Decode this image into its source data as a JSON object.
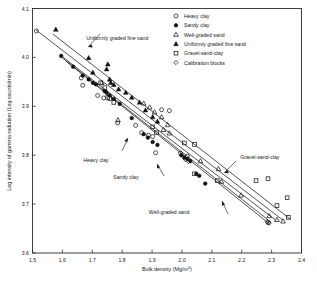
{
  "chart_data": {
    "type": "scatter",
    "title": "",
    "xlabel": "Bulk density (Mg/m³)",
    "ylabel": "Log intensity of gamma radiation (Log counts/min)",
    "xlim": [
      1.5,
      2.4
    ],
    "ylim": [
      3.6,
      4.1
    ],
    "xticks": [
      "1.5",
      "1.6",
      "1.7",
      "1.8",
      "1.9",
      "2.0",
      "2.1",
      "2.2",
      "2.3",
      "2.4"
    ],
    "yticks": [
      "3.6",
      "3.7",
      "3.8",
      "3.9",
      "4.0",
      "4.1"
    ],
    "grid": false,
    "legend_position": "top-right",
    "legend": [
      {
        "label": "Heavy clay",
        "marker": "open-circle"
      },
      {
        "label": "Sandy clay",
        "marker": "filled-circle"
      },
      {
        "label": "Well-graded sand",
        "marker": "open-triangle"
      },
      {
        "label": "Uniformly graded fine sand",
        "marker": "filled-triangle"
      },
      {
        "label": "Gravel-sand-clay",
        "marker": "open-square"
      },
      {
        "label": "Calibration blocks",
        "marker": "open-diamond"
      }
    ],
    "annotations": [
      {
        "text": "Uniformly graded fine sand",
        "x": 1.68,
        "y": 4.035
      },
      {
        "text": "Heavy clay",
        "x": 1.755,
        "y": 3.787
      },
      {
        "text": "Sandy clay",
        "x": 1.855,
        "y": 3.752
      },
      {
        "text": "Gravel-sand-clay",
        "x": 2.195,
        "y": 3.793
      },
      {
        "text": "Well-graded sand",
        "x": 2.025,
        "y": 3.679
      }
    ],
    "series": [
      {
        "name": "Heavy clay",
        "marker": "open-circle",
        "points": [
          [
            1.513,
            4.054
          ],
          [
            1.663,
            3.958
          ],
          [
            1.668,
            3.943
          ],
          [
            1.718,
            3.922
          ],
          [
            1.738,
            3.917
          ],
          [
            1.785,
            3.866
          ],
          [
            1.845,
            3.861
          ],
          [
            1.865,
            3.846
          ],
          [
            1.888,
            3.841
          ],
          [
            1.902,
            3.838
          ],
          [
            1.912,
            3.805
          ],
          [
            1.932,
            3.893
          ],
          [
            1.958,
            3.891
          ],
          [
            1.995,
            3.804
          ],
          [
            2.018,
            3.798
          ],
          [
            2.288,
            3.662
          ]
        ]
      },
      {
        "name": "Sandy clay",
        "marker": "filled-circle",
        "points": [
          [
            1.596,
            4.003
          ],
          [
            1.636,
            3.981
          ],
          [
            1.668,
            3.963
          ],
          [
            1.688,
            3.955
          ],
          [
            1.702,
            3.948
          ],
          [
            1.712,
            3.945
          ],
          [
            1.742,
            3.931
          ],
          [
            1.748,
            3.928
          ],
          [
            1.758,
            3.922
          ],
          [
            1.772,
            3.915
          ],
          [
            1.792,
            3.905
          ],
          [
            1.832,
            3.876
          ],
          [
            1.872,
            3.843
          ],
          [
            1.886,
            3.836
          ],
          [
            1.902,
            3.827
          ],
          [
            1.918,
            3.821
          ],
          [
            1.998,
            3.8
          ],
          [
            2.008,
            3.795
          ],
          [
            2.018,
            3.792
          ],
          [
            2.028,
            3.788
          ],
          [
            2.048,
            3.762
          ],
          [
            2.058,
            3.758
          ],
          [
            2.078,
            3.742
          ]
        ]
      },
      {
        "name": "Well-graded sand",
        "marker": "open-triangle",
        "points": [
          [
            1.732,
            3.948
          ],
          [
            1.786,
            3.872
          ],
          [
            1.872,
            3.906
          ],
          [
            1.892,
            3.898
          ],
          [
            1.908,
            3.888
          ],
          [
            1.932,
            3.878
          ],
          [
            1.952,
            3.862
          ],
          [
            1.938,
            3.852
          ],
          [
            1.958,
            3.845
          ],
          [
            2.062,
            3.788
          ],
          [
            2.122,
            3.772
          ],
          [
            2.132,
            3.746
          ],
          [
            2.198,
            3.718
          ],
          [
            2.292,
            3.676
          ],
          [
            2.318,
            3.668
          ],
          [
            2.338,
            3.665
          ]
        ]
      },
      {
        "name": "Uniformly graded fine sand",
        "marker": "filled-triangle",
        "points": [
          [
            1.578,
            4.057
          ],
          [
            1.688,
            3.999
          ],
          [
            1.702,
            3.969
          ],
          [
            1.748,
            3.976
          ],
          [
            1.752,
            3.986
          ],
          [
            1.758,
            3.955
          ],
          [
            1.762,
            3.948
          ],
          [
            1.772,
            3.944
          ],
          [
            1.788,
            3.935
          ],
          [
            1.812,
            3.928
          ],
          [
            1.832,
            3.918
          ],
          [
            1.858,
            3.908
          ],
          [
            1.878,
            3.892
          ],
          [
            1.902,
            3.878
          ],
          [
            1.918,
            3.869
          ]
        ]
      },
      {
        "name": "Gravel-sand-clay",
        "marker": "open-square",
        "points": [
          [
            1.728,
            3.948
          ],
          [
            1.742,
            3.938
          ],
          [
            1.752,
            3.918
          ],
          [
            1.758,
            3.916
          ],
          [
            1.772,
            3.908
          ],
          [
            1.902,
            3.858
          ],
          [
            1.915,
            3.846
          ],
          [
            2.008,
            3.825
          ],
          [
            2.042,
            3.822
          ],
          [
            2.042,
            3.762
          ],
          [
            2.118,
            3.748
          ],
          [
            2.248,
            3.748
          ],
          [
            2.288,
            3.752
          ],
          [
            2.318,
            3.697
          ],
          [
            2.352,
            3.713
          ],
          [
            2.356,
            3.673
          ]
        ]
      },
      {
        "name": "Calibration blocks",
        "marker": "open-diamond",
        "points": [
          [
            2.012,
            3.791
          ],
          [
            2.022,
            3.787
          ],
          [
            2.285,
            3.664
          ],
          [
            2.292,
            3.661
          ]
        ]
      }
    ],
    "fit_lines": [
      {
        "name": "Uniformly graded fine sand",
        "x1": 1.512,
        "y1": 4.056,
        "x2": 2.338,
        "y2": 3.667
      },
      {
        "name": "Gravel-sand-clay",
        "x1": 1.568,
        "y1": 4.048,
        "x2": 2.365,
        "y2": 3.668
      },
      {
        "name": "Heavy clay",
        "x1": 1.592,
        "y1": 4.005,
        "x2": 2.312,
        "y2": 3.668
      },
      {
        "name": "Sandy clay",
        "x1": 1.6,
        "y1": 3.999,
        "x2": 2.298,
        "y2": 3.663
      },
      {
        "name": "Well-graded sand",
        "x1": 1.612,
        "y1": 3.992,
        "x2": 2.292,
        "y2": 3.66
      }
    ]
  }
}
